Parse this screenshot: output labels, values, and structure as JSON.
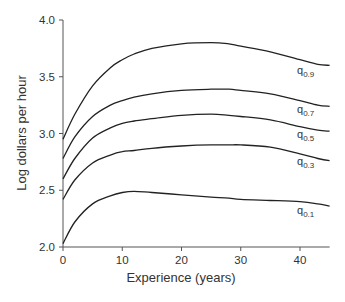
{
  "chart_data": {
    "type": "line",
    "title": "",
    "xlabel": "Experience (years)",
    "ylabel": "Log dollars per hour",
    "xlim": [
      0,
      45
    ],
    "ylim": [
      2.0,
      4.0
    ],
    "xticks": [
      0,
      10,
      20,
      30,
      40
    ],
    "yticks": [
      "2.0",
      "2.5",
      "3.0",
      "3.5",
      "4.0"
    ],
    "grid": false,
    "legend": "inline labels at right end of curves",
    "x": [
      0,
      2,
      5,
      8,
      10,
      12,
      15,
      20,
      25,
      28,
      30,
      35,
      40,
      43,
      45
    ],
    "series": [
      {
        "name": "q0.9",
        "label_main": "q",
        "label_sub": "0.9",
        "values": [
          2.95,
          3.17,
          3.42,
          3.58,
          3.65,
          3.7,
          3.75,
          3.79,
          3.8,
          3.79,
          3.77,
          3.72,
          3.65,
          3.61,
          3.6
        ]
      },
      {
        "name": "q0.7",
        "label_main": "q",
        "label_sub": "0.7",
        "values": [
          2.78,
          2.97,
          3.15,
          3.25,
          3.29,
          3.32,
          3.35,
          3.38,
          3.39,
          3.39,
          3.38,
          3.35,
          3.29,
          3.25,
          3.24
        ]
      },
      {
        "name": "q0.5",
        "label_main": "q",
        "label_sub": "0.5",
        "values": [
          2.6,
          2.78,
          2.96,
          3.05,
          3.09,
          3.11,
          3.13,
          3.16,
          3.17,
          3.16,
          3.15,
          3.12,
          3.06,
          3.03,
          3.02
        ]
      },
      {
        "name": "q0.3",
        "label_main": "q",
        "label_sub": "0.3",
        "values": [
          2.42,
          2.59,
          2.74,
          2.81,
          2.84,
          2.85,
          2.87,
          2.89,
          2.9,
          2.9,
          2.9,
          2.88,
          2.82,
          2.78,
          2.76
        ]
      },
      {
        "name": "q0.1",
        "label_main": "q",
        "label_sub": "0.1",
        "values": [
          2.03,
          2.22,
          2.38,
          2.45,
          2.48,
          2.49,
          2.48,
          2.46,
          2.44,
          2.43,
          2.42,
          2.41,
          2.4,
          2.38,
          2.36
        ]
      }
    ]
  }
}
